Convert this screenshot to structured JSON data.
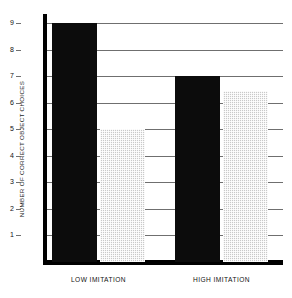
{
  "chart_data": {
    "type": "bar",
    "title": "",
    "xlabel": "",
    "ylabel": "NUMBER OF CORRECT OBJECT CHOICES",
    "categories": [
      "LOW IMITATION",
      "HIGH IMITATION"
    ],
    "series": [
      {
        "name": "solid-black-bar",
        "color": "#0c0c0c",
        "values": [
          9,
          7
        ]
      },
      {
        "name": "gray-hatched-bar",
        "color": "#c9c9c9",
        "values": [
          5,
          6.45
        ]
      }
    ],
    "ylim": [
      0,
      9.3
    ],
    "yticks": [
      1,
      2,
      3,
      4,
      5,
      6,
      7,
      8,
      9
    ],
    "ytick_labels": [
      "1",
      "2",
      "3",
      "4",
      "5",
      "6",
      "7",
      "8",
      "9"
    ],
    "grid": true,
    "grid_axis": "y",
    "legend": "none"
  }
}
